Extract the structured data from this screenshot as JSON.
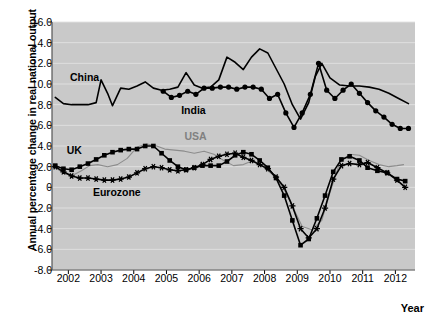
{
  "chart_data": {
    "type": "line",
    "title": "",
    "xlabel": "Year",
    "ylabel": "Annual percentage change in real national output",
    "xlim": [
      2001.5,
      2012.6
    ],
    "ylim": [
      -8.0,
      16.0
    ],
    "grid": true,
    "legend_position": "inline-annotations",
    "plot_background": "#c9c9c9",
    "xticks": [
      "2002",
      "2003",
      "2004",
      "2005",
      "2006",
      "2007",
      "2008",
      "2009",
      "2010",
      "2011",
      "2012"
    ],
    "yticks": [
      "16.0",
      "14.0",
      "12.0",
      "10.0",
      "8.0",
      "6.0",
      "4.0",
      "2.0",
      "0",
      "-2.0",
      "-4.0",
      "-6.0",
      "-8.0"
    ],
    "annotations": [
      {
        "label": "China",
        "x": 2002.05,
        "y": 10.6,
        "color": "#000000"
      },
      {
        "label": "India",
        "x": 2005.45,
        "y": 7.4,
        "color": "#000000"
      },
      {
        "label": "USA",
        "x": 2005.55,
        "y": 4.9,
        "color": "#808080"
      },
      {
        "label": "UK",
        "x": 2001.95,
        "y": 3.5,
        "color": "#000000"
      },
      {
        "label": "Eurozone",
        "x": 2002.75,
        "y": -0.5,
        "color": "#000000"
      }
    ],
    "series": [
      {
        "name": "China",
        "color": "#000000",
        "marker": "none",
        "width": 1.6,
        "points": [
          [
            2001.6,
            8.7
          ],
          [
            2001.85,
            8.1
          ],
          [
            2002.1,
            8.0
          ],
          [
            2002.35,
            8.0
          ],
          [
            2002.6,
            8.0
          ],
          [
            2002.85,
            8.2
          ],
          [
            2003.0,
            10.4
          ],
          [
            2003.2,
            9.1
          ],
          [
            2003.35,
            7.9
          ],
          [
            2003.6,
            9.6
          ],
          [
            2003.85,
            9.5
          ],
          [
            2004.1,
            9.8
          ],
          [
            2004.35,
            10.2
          ],
          [
            2004.6,
            9.6
          ],
          [
            2004.85,
            9.4
          ],
          [
            2005.1,
            9.5
          ],
          [
            2005.35,
            9.7
          ],
          [
            2005.6,
            11.1
          ],
          [
            2005.85,
            9.9
          ],
          [
            2006.1,
            9.6
          ],
          [
            2006.35,
            9.7
          ],
          [
            2006.6,
            10.4
          ],
          [
            2006.85,
            12.6
          ],
          [
            2007.1,
            12.1
          ],
          [
            2007.35,
            11.4
          ],
          [
            2007.6,
            12.6
          ],
          [
            2007.85,
            13.4
          ],
          [
            2008.1,
            13.0
          ],
          [
            2008.35,
            11.5
          ],
          [
            2008.6,
            10.0
          ],
          [
            2008.85,
            8.0
          ],
          [
            2009.1,
            6.6
          ],
          [
            2009.35,
            8.2
          ],
          [
            2009.55,
            10.7
          ],
          [
            2009.75,
            12.0
          ],
          [
            2010.0,
            10.6
          ],
          [
            2010.3,
            9.9
          ],
          [
            2010.6,
            9.8
          ],
          [
            2010.9,
            9.8
          ],
          [
            2011.2,
            9.7
          ],
          [
            2011.5,
            9.5
          ],
          [
            2011.8,
            9.1
          ],
          [
            2012.1,
            8.6
          ],
          [
            2012.4,
            8.1
          ]
        ]
      },
      {
        "name": "India",
        "color": "#000000",
        "marker": "circle",
        "width": 1.6,
        "points": [
          [
            2004.9,
            9.3
          ],
          [
            2005.15,
            8.7
          ],
          [
            2005.4,
            8.9
          ],
          [
            2005.65,
            9.3
          ],
          [
            2005.9,
            9.0
          ],
          [
            2006.15,
            9.6
          ],
          [
            2006.4,
            9.6
          ],
          [
            2006.65,
            9.7
          ],
          [
            2006.9,
            9.7
          ],
          [
            2007.15,
            9.5
          ],
          [
            2007.4,
            9.7
          ],
          [
            2007.65,
            9.7
          ],
          [
            2007.9,
            9.5
          ],
          [
            2008.15,
            8.6
          ],
          [
            2008.4,
            9.0
          ],
          [
            2008.65,
            7.2
          ],
          [
            2008.9,
            5.8
          ],
          [
            2009.15,
            7.2
          ],
          [
            2009.4,
            9.0
          ],
          [
            2009.65,
            12.0
          ],
          [
            2009.9,
            9.4
          ],
          [
            2010.15,
            8.6
          ],
          [
            2010.4,
            9.4
          ],
          [
            2010.65,
            10.0
          ],
          [
            2010.9,
            9.1
          ],
          [
            2011.15,
            8.2
          ],
          [
            2011.4,
            7.4
          ],
          [
            2011.65,
            6.8
          ],
          [
            2011.9,
            6.1
          ],
          [
            2012.15,
            5.7
          ],
          [
            2012.4,
            5.7
          ]
        ]
      },
      {
        "name": "USA",
        "color": "#8c8c8c",
        "marker": "none",
        "width": 1.1,
        "points": [
          [
            2001.6,
            1.9
          ],
          [
            2001.9,
            1.3
          ],
          [
            2002.15,
            1.2
          ],
          [
            2002.4,
            1.6
          ],
          [
            2002.65,
            2.1
          ],
          [
            2002.9,
            2.2
          ],
          [
            2003.2,
            2.0
          ],
          [
            2003.5,
            2.2
          ],
          [
            2003.8,
            2.8
          ],
          [
            2004.1,
            3.9
          ],
          [
            2004.4,
            4.2
          ],
          [
            2004.7,
            4.0
          ],
          [
            2004.95,
            3.7
          ],
          [
            2005.25,
            3.6
          ],
          [
            2005.55,
            3.5
          ],
          [
            2005.85,
            3.3
          ],
          [
            2006.15,
            3.5
          ],
          [
            2006.45,
            3.2
          ],
          [
            2006.75,
            2.6
          ],
          [
            2007.05,
            2.1
          ],
          [
            2007.35,
            2.2
          ],
          [
            2007.65,
            2.6
          ],
          [
            2007.95,
            2.0
          ],
          [
            2008.25,
            1.2
          ],
          [
            2008.55,
            0.1
          ],
          [
            2008.85,
            -1.8
          ],
          [
            2009.15,
            -3.8
          ],
          [
            2009.45,
            -4.1
          ],
          [
            2009.75,
            -3.2
          ],
          [
            2010.0,
            -0.5
          ],
          [
            2010.3,
            2.4
          ],
          [
            2010.6,
            3.2
          ],
          [
            2010.9,
            3.1
          ],
          [
            2011.2,
            2.6
          ],
          [
            2011.5,
            2.2
          ],
          [
            2011.8,
            2.0
          ],
          [
            2012.05,
            2.1
          ],
          [
            2012.25,
            2.2
          ]
        ]
      },
      {
        "name": "UK",
        "color": "#000000",
        "marker": "square",
        "width": 1.6,
        "points": [
          [
            2001.6,
            2.1
          ],
          [
            2001.85,
            1.8
          ],
          [
            2002.1,
            1.7
          ],
          [
            2002.35,
            2.0
          ],
          [
            2002.6,
            2.3
          ],
          [
            2002.85,
            2.7
          ],
          [
            2003.1,
            3.1
          ],
          [
            2003.35,
            3.4
          ],
          [
            2003.6,
            3.6
          ],
          [
            2003.85,
            3.7
          ],
          [
            2004.1,
            3.7
          ],
          [
            2004.35,
            4.0
          ],
          [
            2004.6,
            4.0
          ],
          [
            2004.85,
            3.3
          ],
          [
            2005.1,
            2.6
          ],
          [
            2005.35,
            2.0
          ],
          [
            2005.6,
            1.7
          ],
          [
            2005.85,
            1.9
          ],
          [
            2006.1,
            2.1
          ],
          [
            2006.35,
            2.1
          ],
          [
            2006.6,
            2.1
          ],
          [
            2006.85,
            2.5
          ],
          [
            2007.1,
            3.1
          ],
          [
            2007.35,
            3.4
          ],
          [
            2007.6,
            3.2
          ],
          [
            2007.85,
            2.6
          ],
          [
            2008.1,
            1.9
          ],
          [
            2008.35,
            0.9
          ],
          [
            2008.6,
            -0.8
          ],
          [
            2008.85,
            -3.2
          ],
          [
            2009.1,
            -5.6
          ],
          [
            2009.35,
            -5.0
          ],
          [
            2009.6,
            -3.0
          ],
          [
            2009.85,
            -0.8
          ],
          [
            2010.1,
            1.5
          ],
          [
            2010.35,
            2.7
          ],
          [
            2010.6,
            3.0
          ],
          [
            2010.9,
            2.6
          ],
          [
            2011.15,
            1.9
          ],
          [
            2011.45,
            1.6
          ],
          [
            2011.75,
            1.4
          ],
          [
            2012.05,
            0.8
          ],
          [
            2012.3,
            0.6
          ]
        ]
      },
      {
        "name": "Eurozone",
        "color": "#000000",
        "marker": "star",
        "width": 1.6,
        "points": [
          [
            2001.6,
            2.0
          ],
          [
            2001.85,
            1.5
          ],
          [
            2002.1,
            1.1
          ],
          [
            2002.35,
            0.9
          ],
          [
            2002.6,
            0.9
          ],
          [
            2002.85,
            0.8
          ],
          [
            2003.1,
            0.7
          ],
          [
            2003.35,
            0.7
          ],
          [
            2003.6,
            0.8
          ],
          [
            2003.85,
            1.0
          ],
          [
            2004.1,
            1.4
          ],
          [
            2004.35,
            1.8
          ],
          [
            2004.6,
            2.0
          ],
          [
            2004.85,
            1.9
          ],
          [
            2005.1,
            1.7
          ],
          [
            2005.35,
            1.6
          ],
          [
            2005.6,
            1.7
          ],
          [
            2005.85,
            1.9
          ],
          [
            2006.1,
            2.2
          ],
          [
            2006.35,
            2.7
          ],
          [
            2006.6,
            3.0
          ],
          [
            2006.85,
            3.2
          ],
          [
            2007.1,
            3.3
          ],
          [
            2007.35,
            2.9
          ],
          [
            2007.6,
            2.6
          ],
          [
            2007.85,
            2.2
          ],
          [
            2008.1,
            1.8
          ],
          [
            2008.35,
            1.0
          ],
          [
            2008.6,
            0.0
          ],
          [
            2008.85,
            -1.8
          ],
          [
            2009.1,
            -4.0
          ],
          [
            2009.35,
            -4.9
          ],
          [
            2009.6,
            -4.0
          ],
          [
            2009.85,
            -2.0
          ],
          [
            2010.1,
            0.8
          ],
          [
            2010.35,
            2.1
          ],
          [
            2010.6,
            2.3
          ],
          [
            2010.9,
            2.2
          ],
          [
            2011.15,
            2.4
          ],
          [
            2011.45,
            1.9
          ],
          [
            2011.75,
            1.4
          ],
          [
            2012.05,
            0.7
          ],
          [
            2012.3,
            0.0
          ]
        ]
      }
    ]
  }
}
